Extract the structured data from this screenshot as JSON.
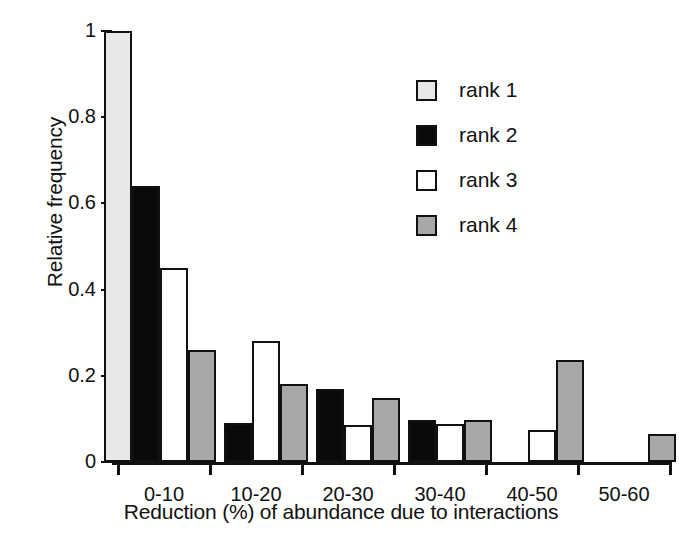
{
  "chart_data": {
    "type": "bar",
    "title": "",
    "xlabel": "Reduction (%) of abundance due to interactions",
    "ylabel": "Relative frequency",
    "categories": [
      "0-10",
      "10-20",
      "20-30",
      "30-40",
      "40-50",
      "50-60"
    ],
    "ylim": [
      0,
      1
    ],
    "yticks": [
      0,
      0.2,
      0.4,
      0.6,
      0.8,
      1
    ],
    "ytick_labels": [
      "0",
      "0.2",
      "0.4",
      "0.6",
      "0.8",
      "1"
    ],
    "grid": false,
    "legend_position": "upper right",
    "series": [
      {
        "name": "rank 1",
        "color": "#e8e8e8",
        "values": [
          1.0,
          0,
          0,
          0,
          0,
          0
        ]
      },
      {
        "name": "rank 2",
        "color": "#0a0a0a",
        "values": [
          0.64,
          0.09,
          0.17,
          0.098,
          0,
          0
        ]
      },
      {
        "name": "rank 3",
        "color": "#ffffff",
        "values": [
          0.45,
          0.28,
          0.085,
          0.088,
          0.075,
          0
        ]
      },
      {
        "name": "rank 4",
        "color": "#a8a8a8",
        "values": [
          0.26,
          0.18,
          0.148,
          0.098,
          0.236,
          0.065
        ]
      }
    ]
  },
  "axis": {
    "y_label": "Relative frequency",
    "x_label": "Reduction (%) of abundance due to interactions",
    "y_tick_labels": [
      "1",
      "0.8",
      "0.6",
      "0.4",
      "0.2",
      "0"
    ],
    "x_tick_labels": [
      "0-10",
      "10-20",
      "20-30",
      "30-40",
      "40-50",
      "50-60"
    ]
  },
  "legend": {
    "items": [
      {
        "label": "rank 1",
        "color": "#e8e8e8"
      },
      {
        "label": "rank 2",
        "color": "#0a0a0a"
      },
      {
        "label": "rank 3",
        "color": "#ffffff"
      },
      {
        "label": "rank 4",
        "color": "#a8a8a8"
      }
    ]
  }
}
